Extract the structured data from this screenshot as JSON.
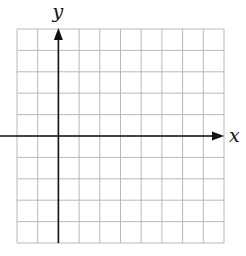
{
  "diagram": {
    "type": "coordinate-grid",
    "grid": {
      "columns": 10,
      "rows": 10,
      "left": 17,
      "top": 29,
      "cell_width": 20.7,
      "cell_height": 21.4,
      "line_color": "#b8b8b8"
    },
    "axes": {
      "x_label": "x",
      "y_label": "y",
      "origin_column": 2,
      "origin_row": 5,
      "color": "#111111"
    }
  }
}
